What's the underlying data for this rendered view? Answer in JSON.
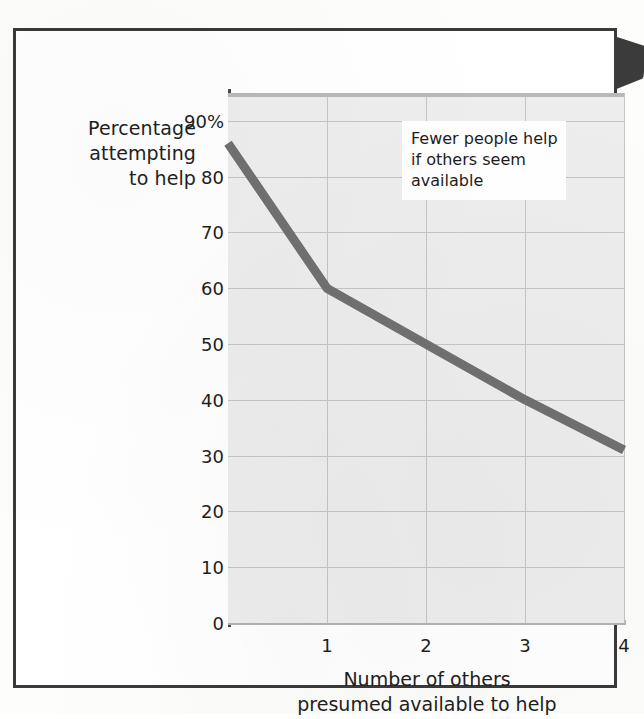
{
  "figure": {
    "y_axis_caption_lines": [
      "Percentage",
      "attempting",
      "to help"
    ],
    "x_axis_caption_lines": [
      "Number of others",
      "presumed available to help"
    ],
    "annotation_lines": [
      "Fewer people help",
      "if others seem",
      "available"
    ],
    "edge_tab_name": "page-edge-tab"
  },
  "chart_data": {
    "type": "line",
    "title": "",
    "subtitle": "",
    "xlabel": "Number of others presumed available to help",
    "ylabel": "Percentage attempting to help",
    "x": [
      0,
      1,
      2,
      3,
      4
    ],
    "series": [
      {
        "name": "Percentage attempting to help",
        "values": [
          86,
          60,
          50,
          40,
          31
        ],
        "color": "#707070"
      }
    ],
    "xlim": [
      0,
      4
    ],
    "ylim": [
      0,
      95
    ],
    "xticks": [
      1,
      2,
      3,
      4
    ],
    "xtick_labels": [
      "1",
      "2",
      "3",
      "4"
    ],
    "yticks": [
      0,
      10,
      20,
      30,
      40,
      50,
      60,
      70,
      80,
      90
    ],
    "ytick_labels": [
      "0",
      "10",
      "20",
      "30",
      "40",
      "50",
      "60",
      "70",
      "80",
      "90%"
    ],
    "grid": true,
    "grid_color": "#c4c4c4",
    "plot_background": "#ededed",
    "legend": false,
    "legend_position": "none",
    "annotations": [
      {
        "text": "Fewer people help if others seem available",
        "x": 2.1,
        "y": 84
      }
    ]
  },
  "colors": {
    "line": "#707070",
    "plot_bg": "#ededed",
    "grid": "#c4c4c4",
    "frame": "#3a3a3a",
    "text": "#1e1e1e",
    "axis": "#4a4a4a",
    "tab": "#3b3b3b"
  }
}
